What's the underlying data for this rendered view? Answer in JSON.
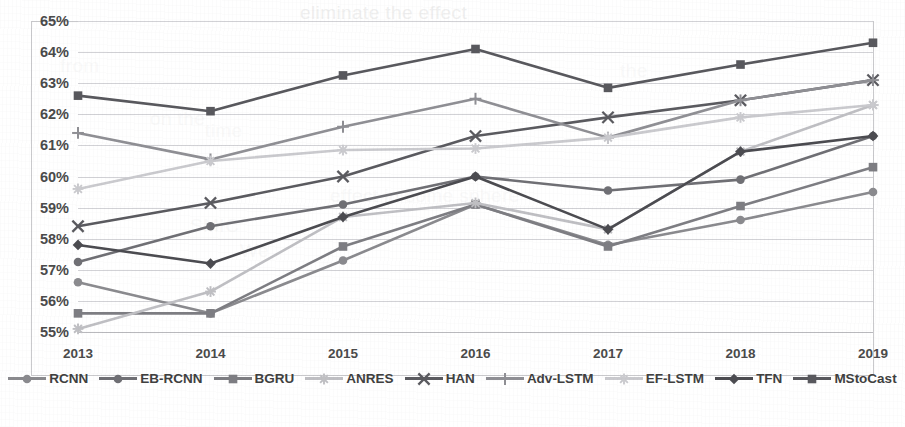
{
  "chart_data": {
    "type": "line",
    "title": "",
    "subtitle": "",
    "xlabel": "",
    "ylabel": "",
    "categories": [
      "2013",
      "2014",
      "2015",
      "2016",
      "2017",
      "2018",
      "2019"
    ],
    "ylim": [
      55,
      65
    ],
    "ytick_step": 1,
    "ytick_labels": [
      "65%",
      "64%",
      "63%",
      "62%",
      "61%",
      "60%",
      "59%",
      "58%",
      "57%",
      "56%",
      "55%"
    ],
    "ytick_values": [
      65,
      64,
      63,
      62,
      61,
      60,
      59,
      58,
      57,
      56,
      55
    ],
    "grid": true,
    "legend_position": "bottom",
    "value_suffix": "%",
    "series": [
      {
        "name": "RCNN",
        "color": "#8a8a8e",
        "marker": "circle",
        "values": [
          56.6,
          55.6,
          57.3,
          59.1,
          57.8,
          58.6,
          59.5
        ]
      },
      {
        "name": "EB-RCNN",
        "color": "#6f6f74",
        "marker": "circle",
        "values": [
          57.25,
          58.4,
          59.1,
          60.0,
          59.55,
          59.9,
          61.3
        ]
      },
      {
        "name": "BGRU",
        "color": "#7d7d82",
        "marker": "square",
        "values": [
          55.6,
          55.6,
          57.75,
          59.1,
          57.75,
          59.05,
          60.3
        ]
      },
      {
        "name": "ANRES",
        "color": "#bfbfc3",
        "marker": "asterisk",
        "values": [
          55.1,
          56.3,
          58.7,
          59.15,
          58.3,
          60.8,
          62.3
        ]
      },
      {
        "name": "HAN",
        "color": "#5a5a5f",
        "marker": "cross-x",
        "values": [
          58.4,
          59.15,
          60.0,
          61.3,
          61.9,
          62.45,
          63.1
        ]
      },
      {
        "name": "Adv-LSTM",
        "color": "#8f8f94",
        "marker": "plus",
        "values": [
          61.4,
          60.55,
          61.6,
          62.5,
          61.25,
          62.45,
          63.1
        ]
      },
      {
        "name": "EF-LSTM",
        "color": "#cacace",
        "marker": "asterisk",
        "values": [
          59.6,
          60.5,
          60.85,
          60.9,
          61.25,
          61.9,
          62.3
        ]
      },
      {
        "name": "TFN",
        "color": "#4b4b50",
        "marker": "diamond",
        "values": [
          57.8,
          57.2,
          58.7,
          60.0,
          58.3,
          60.8,
          61.3
        ]
      },
      {
        "name": "MStoCast",
        "color": "#58585d",
        "marker": "square",
        "values": [
          62.6,
          62.1,
          63.25,
          64.1,
          62.85,
          63.6,
          64.3
        ]
      }
    ]
  },
  "legend": {
    "items": [
      "RCNN",
      "EB-RCNN",
      "BGRU",
      "ANRES",
      "HAN",
      "Adv-LSTM",
      "EF-LSTM",
      "TFN",
      "MStoCast"
    ]
  },
  "ghost_text": {
    "lines": [
      "eliminate     the    effect",
      "from",
      "on the",
      "the",
      "A",
      "time",
      "We",
      "SMIC",
      "effect   in  some  sphere"
    ]
  }
}
